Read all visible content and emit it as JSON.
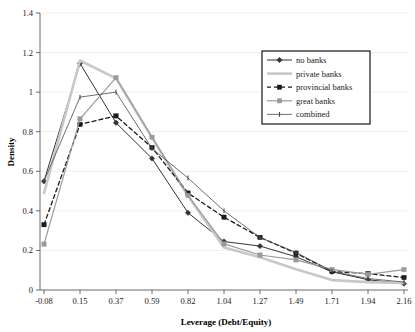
{
  "chart_data": {
    "type": "line",
    "title": "",
    "xlabel": "Leverage (Debt/Equity)",
    "ylabel": "Density",
    "x": [
      -0.08,
      0.15,
      0.37,
      0.59,
      0.82,
      1.04,
      1.27,
      1.49,
      1.71,
      1.94,
      2.16
    ],
    "xtick_labels": [
      "-0.08",
      "0.15",
      "0.37",
      "0.59",
      "0.82",
      "1.04",
      "1.27",
      "1.49",
      "1.71",
      "1.94",
      "2.16"
    ],
    "ytick_labels": [
      "0",
      "0.2",
      "0.4",
      "0.6",
      "0.8",
      "1",
      "1.2",
      "1.4"
    ],
    "ytick_values": [
      0,
      0.2,
      0.4,
      0.6,
      0.8,
      1.0,
      1.2,
      1.4
    ],
    "ylim": [
      0,
      1.4
    ],
    "grid": true,
    "legend_position": "top-right",
    "series": [
      {
        "name": "no banks",
        "color": "#333333",
        "style": "solid",
        "marker": "diamond",
        "width": 1.0,
        "values": [
          0.55,
          1.145,
          0.845,
          0.665,
          0.39,
          0.245,
          0.222,
          0.168,
          0.092,
          0.052,
          0.032
        ]
      },
      {
        "name": "private banks",
        "color": "#c8c8c8",
        "style": "solid",
        "marker": "none",
        "width": 2.6,
        "values": [
          0.49,
          1.16,
          1.07,
          0.77,
          0.475,
          0.215,
          0.165,
          0.105,
          0.05,
          0.04,
          0.035
        ]
      },
      {
        "name": "provincial banks",
        "color": "#1a1a1a",
        "style": "dashed",
        "marker": "square",
        "width": 1.3,
        "values": [
          0.33,
          0.837,
          0.88,
          0.72,
          0.49,
          0.368,
          0.266,
          0.186,
          0.093,
          0.083,
          0.063
        ]
      },
      {
        "name": "great banks",
        "color": "#9a9a9a",
        "style": "solid",
        "marker": "square",
        "width": 1.2,
        "values": [
          0.232,
          0.865,
          1.073,
          0.772,
          0.478,
          0.233,
          0.177,
          0.152,
          0.104,
          0.079,
          0.103
        ]
      },
      {
        "name": "combined",
        "color": "#4a4a4a",
        "style": "solid",
        "marker": "tick",
        "width": 0.8,
        "values": [
          0.55,
          0.975,
          1.0,
          0.715,
          0.566,
          0.4,
          0.265,
          0.19,
          0.095,
          0.058,
          0.04
        ]
      }
    ]
  },
  "legend": {
    "entries": [
      {
        "label": "no banks"
      },
      {
        "label": "private banks"
      },
      {
        "label": "provincial banks"
      },
      {
        "label": "great banks"
      },
      {
        "label": "combined"
      }
    ]
  },
  "axes": {
    "x_title": "Leverage (Debt/Equity)",
    "y_title": "Density"
  }
}
